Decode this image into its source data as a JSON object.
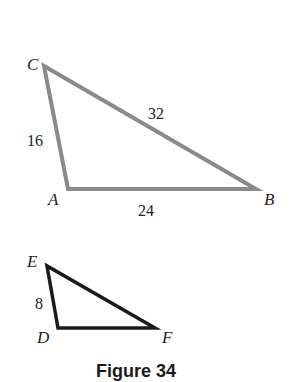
{
  "figure": {
    "caption": "Figure 34",
    "triangle_abc": {
      "stroke_color": "#8a8a8a",
      "vertices": {
        "C": "C",
        "A": "A",
        "B": "B"
      },
      "sides": {
        "CA": "16",
        "AB": "24",
        "CB": "32"
      }
    },
    "triangle_def": {
      "stroke_color": "#1a1a1a",
      "vertices": {
        "E": "E",
        "D": "D",
        "F": "F"
      },
      "sides": {
        "ED": "8"
      }
    }
  }
}
